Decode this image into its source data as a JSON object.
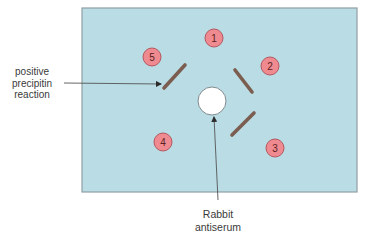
{
  "diagram": {
    "type": "Ouchterlony double immunodiffusion plate",
    "plate": {
      "x": 82,
      "y": 8,
      "width": 275,
      "height": 184,
      "fill": "#b9dce5",
      "stroke": "#8f9ea3"
    },
    "center_well": {
      "cx": 212,
      "cy": 101,
      "r": 14,
      "fill": "#ffffff",
      "stroke": "#7f8b8f"
    },
    "outer_wells": [
      {
        "id": "1",
        "label": "1",
        "cx": 214,
        "cy": 38
      },
      {
        "id": "2",
        "label": "2",
        "cx": 270,
        "cy": 66
      },
      {
        "id": "3",
        "label": "3",
        "cx": 275,
        "cy": 148
      },
      {
        "id": "4",
        "label": "4",
        "cx": 163,
        "cy": 142
      },
      {
        "id": "5",
        "label": "5",
        "cx": 152,
        "cy": 57
      }
    ],
    "well_style": {
      "r": 9,
      "fill": "#ef8a90",
      "stroke": "#b5575e",
      "text_color": "#5a1f22"
    },
    "precipitin_lines": [
      {
        "between": "center-5",
        "x1": 164,
        "y1": 88,
        "x2": 185,
        "y2": 65
      },
      {
        "between": "center-2",
        "x1": 235,
        "y1": 70,
        "x2": 252,
        "y2": 92
      },
      {
        "between": "center-3",
        "x1": 232,
        "y1": 135,
        "x2": 254,
        "y2": 113
      }
    ],
    "line_color": "#7b5e50",
    "annotations": {
      "positive_precipitin": {
        "lines": [
          "positive",
          "precipitin",
          "reaction"
        ],
        "arrow": {
          "x1": 64,
          "y1": 83,
          "x2": 161,
          "y2": 84
        }
      },
      "rabbit_antiserum": {
        "lines": [
          "Rabbit",
          "antiserum"
        ],
        "arrow": {
          "x1": 218,
          "y1": 200,
          "x2": 214,
          "y2": 117
        }
      }
    }
  }
}
